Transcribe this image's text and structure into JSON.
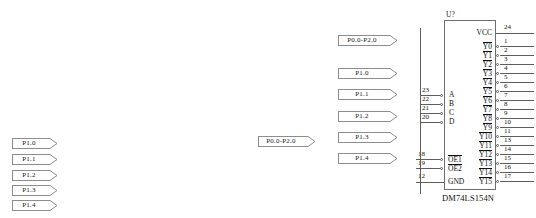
{
  "diagram": {
    "background_color": "#ffffff",
    "line_color": "#5d5d5d",
    "text_color": "#111111"
  },
  "left_flags": [
    {
      "label": "P1.0",
      "x": 12,
      "y": 138,
      "w": 38
    },
    {
      "label": "P1.1",
      "x": 12,
      "y": 154,
      "w": 38
    },
    {
      "label": "P1.2",
      "x": 12,
      "y": 170,
      "w": 38
    },
    {
      "label": "P1.3",
      "x": 12,
      "y": 185,
      "w": 38
    },
    {
      "label": "P1.4",
      "x": 12,
      "y": 200,
      "w": 38
    }
  ],
  "middle_flags": [
    {
      "label": "P0.0-P2.0",
      "x": 258,
      "y": 136,
      "w": 50
    }
  ],
  "column_flags": [
    {
      "label": "P0.0-P2.0",
      "x": 338,
      "y": 35,
      "w": 52
    },
    {
      "label": "P1.0",
      "x": 338,
      "y": 68,
      "w": 52
    },
    {
      "label": "P1.1",
      "x": 338,
      "y": 89,
      "w": 52
    },
    {
      "label": "P1.2",
      "x": 338,
      "y": 111,
      "w": 52
    },
    {
      "label": "P1.3",
      "x": 338,
      "y": 132,
      "w": 52
    },
    {
      "label": "P1.4",
      "x": 338,
      "y": 153,
      "w": 52
    }
  ],
  "ic": {
    "refdes": "U?",
    "part_number": "DM74LS154N",
    "box": {
      "x": 444,
      "y": 20,
      "w": 52,
      "h": 170
    },
    "power_pins": [
      {
        "name": "VCC",
        "number": "24",
        "side": "right",
        "y": 33,
        "overbar": false,
        "bubble": false
      },
      {
        "name": "GND",
        "number": "12",
        "side": "left",
        "y": 182,
        "overbar": false,
        "bubble": false
      }
    ],
    "input_pins": [
      {
        "name": "A",
        "number": "23",
        "y": 95,
        "overbar": false,
        "bubble": true
      },
      {
        "name": "B",
        "number": "22",
        "y": 104,
        "overbar": false,
        "bubble": true
      },
      {
        "name": "C",
        "number": "21",
        "y": 113,
        "overbar": false,
        "bubble": true
      },
      {
        "name": "D",
        "number": "20",
        "y": 122,
        "overbar": false,
        "bubble": true
      }
    ],
    "enable_pins": [
      {
        "name": "OE1",
        "number": "18",
        "y": 159,
        "overbar": true,
        "bubble": true
      },
      {
        "name": "OE2",
        "number": "19",
        "y": 168,
        "overbar": true,
        "bubble": true
      }
    ],
    "output_pins": [
      {
        "name": "Y0",
        "number": "1",
        "y": 46,
        "overbar": true,
        "bubble": true
      },
      {
        "name": "Y1",
        "number": "2",
        "y": 55,
        "overbar": true,
        "bubble": true
      },
      {
        "name": "Y2",
        "number": "3",
        "y": 64,
        "overbar": true,
        "bubble": true
      },
      {
        "name": "Y3",
        "number": "4",
        "y": 73,
        "overbar": true,
        "bubble": true
      },
      {
        "name": "Y4",
        "number": "5",
        "y": 82,
        "overbar": true,
        "bubble": true
      },
      {
        "name": "Y5",
        "number": "6",
        "y": 91,
        "overbar": true,
        "bubble": true
      },
      {
        "name": "Y6",
        "number": "7",
        "y": 100,
        "overbar": true,
        "bubble": true
      },
      {
        "name": "Y7",
        "number": "8",
        "y": 109,
        "overbar": true,
        "bubble": true
      },
      {
        "name": "Y8",
        "number": "9",
        "y": 118,
        "overbar": true,
        "bubble": true
      },
      {
        "name": "Y9",
        "number": "10",
        "y": 127,
        "overbar": true,
        "bubble": true
      },
      {
        "name": "Y10",
        "number": "11",
        "y": 136,
        "overbar": true,
        "bubble": true
      },
      {
        "name": "Y11",
        "number": "13",
        "y": 145,
        "overbar": true,
        "bubble": true
      },
      {
        "name": "Y12",
        "number": "14",
        "y": 154,
        "overbar": true,
        "bubble": true
      },
      {
        "name": "Y13",
        "number": "15",
        "y": 163,
        "overbar": true,
        "bubble": true
      },
      {
        "name": "Y14",
        "number": "16",
        "y": 172,
        "overbar": true,
        "bubble": true
      },
      {
        "name": "Y15",
        "number": "17",
        "y": 181,
        "overbar": true,
        "bubble": true
      }
    ]
  }
}
